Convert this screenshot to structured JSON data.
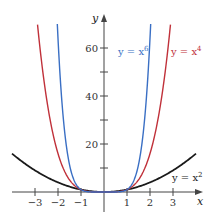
{
  "chart_data": {
    "type": "line",
    "title": "",
    "xlabel": "x",
    "ylabel": "y",
    "xlim": [
      -4,
      4.2
    ],
    "ylim": [
      -5,
      72
    ],
    "grid": false,
    "x_ticks": [
      -3,
      -2,
      -1,
      1,
      2,
      3
    ],
    "x_tick_labels": [
      "−3",
      "−2",
      "−1",
      "1",
      "2",
      "3"
    ],
    "y_ticks": [
      10,
      20,
      30,
      40,
      50,
      60
    ],
    "y_tick_labels": [
      "",
      "20",
      "",
      "40",
      "",
      "60"
    ],
    "series": [
      {
        "name": "y = x^2",
        "label": "y = x",
        "exponent": "2",
        "power": 2,
        "color": "#1a1a1a",
        "domain": [
          -4,
          4
        ]
      },
      {
        "name": "y = x^4",
        "label": "y = x",
        "exponent": "4",
        "power": 4,
        "color": "#c0313a",
        "domain": [
          -2.89,
          2.89
        ]
      },
      {
        "name": "y = x^6",
        "label": "y = x",
        "exponent": "6",
        "power": 6,
        "color": "#3a6fc4",
        "domain": [
          -2.03,
          2.03
        ]
      }
    ]
  }
}
